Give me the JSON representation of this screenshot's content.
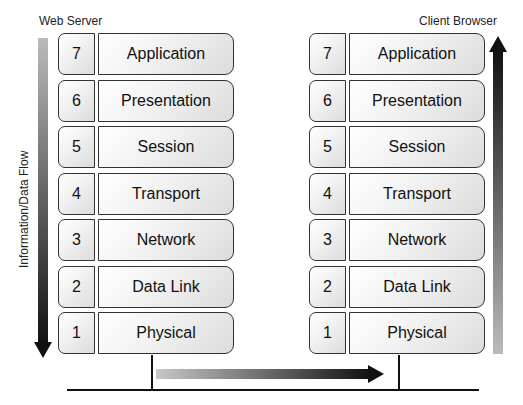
{
  "diagram": {
    "left_stack": {
      "label": "Web Server",
      "layers": [
        {
          "number": "7",
          "name": "Application"
        },
        {
          "number": "6",
          "name": "Presentation"
        },
        {
          "number": "5",
          "name": "Session"
        },
        {
          "number": "4",
          "name": "Transport"
        },
        {
          "number": "3",
          "name": "Network"
        },
        {
          "number": "2",
          "name": "Data Link"
        },
        {
          "number": "1",
          "name": "Physical"
        }
      ]
    },
    "right_stack": {
      "label": "Client Browser",
      "layers": [
        {
          "number": "7",
          "name": "Application"
        },
        {
          "number": "6",
          "name": "Presentation"
        },
        {
          "number": "5",
          "name": "Session"
        },
        {
          "number": "4",
          "name": "Transport"
        },
        {
          "number": "3",
          "name": "Network"
        },
        {
          "number": "2",
          "name": "Data Link"
        },
        {
          "number": "1",
          "name": "Physical"
        }
      ]
    },
    "flow_label": "Information/Data  Flow",
    "arrows": {
      "left": {
        "direction": "down",
        "gradient": [
          "#bbbbbb",
          "#111111"
        ]
      },
      "bottom": {
        "direction": "right",
        "gradient": [
          "#c8c8c8",
          "#111111"
        ]
      },
      "right": {
        "direction": "up",
        "gradient": [
          "#bbbbbb",
          "#111111"
        ]
      }
    }
  }
}
